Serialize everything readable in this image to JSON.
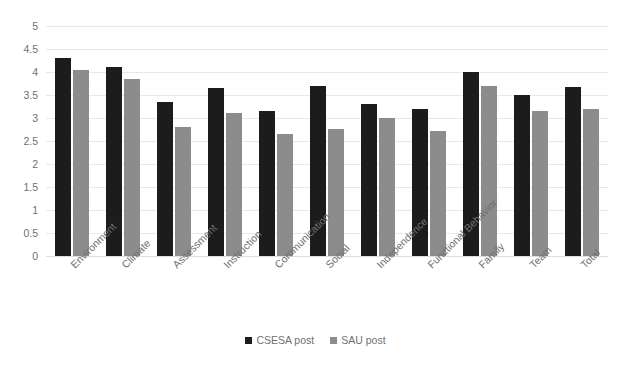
{
  "chart_data": {
    "type": "bar",
    "title": "",
    "subtitle": "",
    "xlabel": "",
    "ylabel": "",
    "ylim": [
      0,
      5
    ],
    "ytick_step": 0.5,
    "yticks": [
      "5",
      "4.5",
      "4",
      "3.5",
      "3",
      "2.5",
      "2",
      "1.5",
      "1",
      "0.5",
      "0"
    ],
    "grid": true,
    "legend_position": "bottom",
    "categories": [
      "Environment",
      "Climate",
      "Assessment",
      "Instruction",
      "Communication",
      "Social",
      "Independence",
      "Functional Behavior",
      "Family",
      "Team",
      "Total"
    ],
    "series": [
      {
        "name": "CSESA post",
        "color": "#1c1c1c",
        "values": [
          4.3,
          4.1,
          3.35,
          3.65,
          3.15,
          3.7,
          3.3,
          3.2,
          4.0,
          3.5,
          3.68
        ]
      },
      {
        "name": "SAU post",
        "color": "#8c8c8c",
        "values": [
          4.05,
          3.85,
          2.8,
          3.1,
          2.65,
          2.77,
          3.0,
          2.72,
          3.7,
          3.15,
          3.2
        ]
      }
    ]
  },
  "colors": {
    "series_dark": "#1c1c1c",
    "series_gray": "#8c8c8c",
    "gridline": "#e8e8e8",
    "axis_text": "#707070",
    "background": "#ffffff"
  }
}
